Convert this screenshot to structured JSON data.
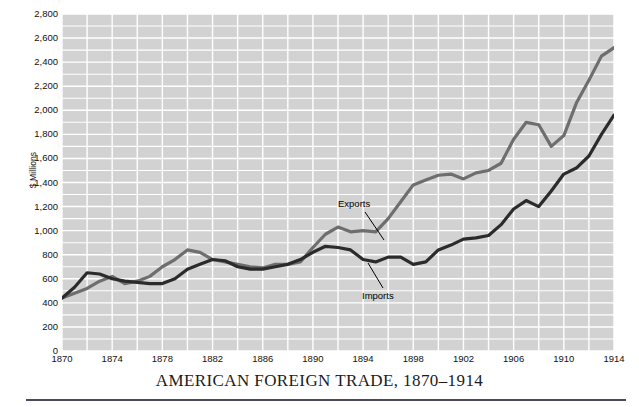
{
  "caption": {
    "title": "AMERICAN FOREIGN TRADE, 1870–1914"
  },
  "axes": {
    "ylabel": "$ Millions",
    "yticks": [
      "0",
      "200",
      "400",
      "600",
      "800",
      "1,000",
      "1,200",
      "1,400",
      "1,600",
      "1,800",
      "2,000",
      "2,200",
      "2,400",
      "2,600",
      "2,800"
    ],
    "xticks": [
      "1870",
      "1874",
      "1878",
      "1882",
      "1886",
      "1890",
      "1894",
      "1898",
      "1902",
      "1906",
      "1910",
      "1914"
    ]
  },
  "annotations": {
    "exports": "Exports",
    "imports": "Imports"
  },
  "colors": {
    "plot_background": "#d2d2d2",
    "gridline": "#ffffff",
    "exports_line": "#6e6e6e",
    "imports_line": "#2b2b2b",
    "text": "#111111",
    "caption_rule": "#4a4a5a"
  },
  "chart_data": {
    "type": "line",
    "title": "AMERICAN FOREIGN TRADE, 1870–1914",
    "xlabel": "",
    "ylabel": "$ Millions",
    "xlim": [
      1870,
      1914
    ],
    "ylim": [
      0,
      2800
    ],
    "ytick_interval": 200,
    "xtick_interval": 4,
    "grid": true,
    "grid_x_interval": 2,
    "grid_y_interval": 100,
    "legend": "inline-annotations",
    "x": [
      1870,
      1871,
      1872,
      1873,
      1874,
      1875,
      1876,
      1877,
      1878,
      1879,
      1880,
      1881,
      1882,
      1883,
      1884,
      1885,
      1886,
      1887,
      1888,
      1889,
      1890,
      1891,
      1892,
      1893,
      1894,
      1895,
      1896,
      1897,
      1898,
      1899,
      1900,
      1901,
      1902,
      1903,
      1904,
      1905,
      1906,
      1907,
      1908,
      1909,
      1910,
      1911,
      1912,
      1913,
      1914
    ],
    "series": [
      {
        "name": "Exports",
        "color": "#6e6e6e",
        "values": [
          440,
          480,
          520,
          580,
          620,
          560,
          580,
          620,
          700,
          760,
          840,
          820,
          760,
          740,
          720,
          700,
          690,
          720,
          720,
          740,
          860,
          970,
          1030,
          990,
          1000,
          990,
          1100,
          1240,
          1380,
          1420,
          1460,
          1470,
          1430,
          1480,
          1500,
          1560,
          1760,
          1900,
          1880,
          1700,
          1790,
          2060,
          2250,
          2450,
          2520
        ]
      },
      {
        "name": "Imports",
        "color": "#2b2b2b",
        "values": [
          440,
          530,
          650,
          640,
          600,
          580,
          570,
          560,
          560,
          600,
          680,
          720,
          760,
          750,
          700,
          680,
          680,
          700,
          720,
          760,
          820,
          870,
          860,
          840,
          760,
          740,
          780,
          780,
          720,
          740,
          840,
          880,
          930,
          940,
          960,
          1050,
          1180,
          1250,
          1200,
          1330,
          1470,
          1520,
          1620,
          1800,
          1960
        ]
      }
    ]
  }
}
